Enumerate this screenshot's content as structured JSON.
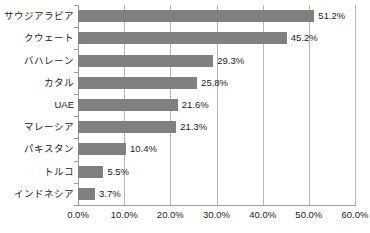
{
  "chart_data": {
    "type": "bar",
    "orientation": "horizontal",
    "title": "",
    "xlabel": "",
    "ylabel": "",
    "xlim": [
      0,
      60
    ],
    "xtick_labels": [
      "0.0%",
      "10.0%",
      "20.0%",
      "30.0%",
      "40.0%",
      "50.0%",
      "60.0%"
    ],
    "xticks": [
      0,
      10,
      20,
      30,
      40,
      50,
      60
    ],
    "grid": "vertical",
    "legend": "none",
    "bar_color": "#808080",
    "gridline_color": "#b6b6b6",
    "axis_color": "#9a9a9a",
    "text_color": "#1a1a1a",
    "categories": [
      "サウジアラビア",
      "クウェート",
      "バハレーン",
      "カタル",
      "UAE",
      "マレーシア",
      "パキスタン",
      "トルコ",
      "インドネシア"
    ],
    "values": [
      51.2,
      45.2,
      29.3,
      25.8,
      21.6,
      21.3,
      10.4,
      5.5,
      3.7
    ],
    "data_labels": [
      "51.2%",
      "45.2%",
      "29.3%",
      "25.8%",
      "21.6%",
      "21.3%",
      "10.4%",
      "5.5%",
      "3.7%"
    ]
  }
}
